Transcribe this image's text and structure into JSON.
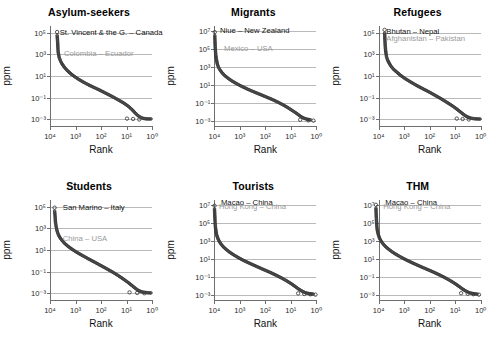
{
  "figure": {
    "panel_count": 6,
    "marker_style": "open-circle",
    "marker_color": "#3a3a3a",
    "grid_color": "#b9b9b9",
    "axis_color": "#6f6f6f",
    "primary_annotation_color": "#111111",
    "secondary_annotation_color": "#9a9a9a"
  },
  "common": {
    "xlabel": "Rank",
    "ylabel": "ppm",
    "xticks": [
      "10⁴",
      "10³",
      "10²",
      "10¹",
      "10⁰"
    ],
    "xtick_exponents": [
      4,
      3,
      2,
      1,
      0
    ],
    "xlim": [
      4,
      0
    ],
    "x_reversed": true
  },
  "chart_data": [
    {
      "type": "scatter",
      "title": "Asylum-seekers",
      "xlabel": "Rank",
      "ylabel": "ppm",
      "xlim": [
        4,
        0
      ],
      "ylim": [
        -3.6,
        5.6
      ],
      "grid": true,
      "xticks": [
        4,
        3,
        2,
        1,
        0
      ],
      "xtick_labels": [
        "10⁴",
        "10³",
        "10²",
        "10¹",
        "10⁰"
      ],
      "yticks": [
        5,
        3,
        1,
        -1,
        -3
      ],
      "ytick_labels": [
        "10⁵",
        "10³",
        "10¹",
        "10⁻¹",
        "10⁻³"
      ],
      "annotations": [
        {
          "text": "St. Vincent & the G. – Canada",
          "style": "primary",
          "x_log": 3.62,
          "y_log": 5.0
        },
        {
          "text": "Colombia – Ecuador",
          "style": "secondary",
          "x_log": 3.45,
          "y_log": 3.0
        }
      ],
      "curve_points_loglog": [
        [
          3.72,
          4.75
        ],
        [
          3.7,
          4.1
        ],
        [
          3.69,
          3.55
        ],
        [
          3.68,
          3.2
        ],
        [
          3.66,
          2.95
        ],
        [
          3.64,
          2.7
        ],
        [
          3.6,
          2.45
        ],
        [
          3.55,
          2.2
        ],
        [
          3.48,
          1.95
        ],
        [
          3.4,
          1.7
        ],
        [
          3.3,
          1.45
        ],
        [
          3.18,
          1.2
        ],
        [
          3.04,
          0.95
        ],
        [
          2.88,
          0.7
        ],
        [
          2.7,
          0.45
        ],
        [
          2.5,
          0.2
        ],
        [
          2.28,
          -0.05
        ],
        [
          2.05,
          -0.3
        ],
        [
          1.8,
          -0.6
        ],
        [
          1.55,
          -0.9
        ],
        [
          1.32,
          -1.2
        ],
        [
          1.1,
          -1.5
        ],
        [
          0.92,
          -1.8
        ],
        [
          0.78,
          -2.1
        ],
        [
          0.66,
          -2.4
        ],
        [
          0.55,
          -2.65
        ],
        [
          0.45,
          -2.8
        ],
        [
          0.34,
          -2.9
        ],
        [
          0.2,
          -2.95
        ],
        [
          0.0,
          -2.95
        ]
      ],
      "tail_outliers": [
        [
          0.98,
          -2.92
        ],
        [
          0.74,
          -2.95
        ],
        [
          0.5,
          -3.0
        ]
      ]
    },
    {
      "type": "scatter",
      "title": "Migrants",
      "xlabel": "Rank",
      "ylabel": "ppm",
      "xlim": [
        4,
        0
      ],
      "ylim": [
        -3.6,
        7.6
      ],
      "grid": true,
      "xticks": [
        4,
        3,
        2,
        1,
        0
      ],
      "xtick_labels": [
        "10⁴",
        "10³",
        "10²",
        "10¹",
        "10⁰"
      ],
      "yticks": [
        7,
        5,
        3,
        1,
        -1,
        -3
      ],
      "ytick_labels": [
        "10⁷",
        "10⁵",
        "10³",
        "10¹",
        "10⁻¹",
        "10⁻³"
      ],
      "annotations": [
        {
          "text": "Niue – New Zealand",
          "style": "primary",
          "x_log": 3.78,
          "y_log": 7.0
        },
        {
          "text": "Mexico – USA",
          "style": "secondary",
          "x_log": 3.62,
          "y_log": 5.0
        }
      ],
      "curve_points_loglog": [
        [
          3.97,
          6.55
        ],
        [
          3.96,
          5.8
        ],
        [
          3.95,
          5.2
        ],
        [
          3.94,
          4.7
        ],
        [
          3.93,
          4.3
        ],
        [
          3.91,
          3.95
        ],
        [
          3.89,
          3.6
        ],
        [
          3.86,
          3.25
        ],
        [
          3.82,
          2.95
        ],
        [
          3.76,
          2.65
        ],
        [
          3.68,
          2.35
        ],
        [
          3.58,
          2.05
        ],
        [
          3.45,
          1.75
        ],
        [
          3.3,
          1.45
        ],
        [
          3.12,
          1.15
        ],
        [
          2.92,
          0.85
        ],
        [
          2.7,
          0.55
        ],
        [
          2.46,
          0.25
        ],
        [
          2.2,
          -0.05
        ],
        [
          1.95,
          -0.35
        ],
        [
          1.7,
          -0.65
        ],
        [
          1.48,
          -0.95
        ],
        [
          1.28,
          -1.25
        ],
        [
          1.1,
          -1.55
        ],
        [
          0.94,
          -1.85
        ],
        [
          0.78,
          -2.15
        ],
        [
          0.64,
          -2.45
        ],
        [
          0.5,
          -2.7
        ],
        [
          0.34,
          -2.85
        ],
        [
          0.18,
          -2.92
        ]
      ],
      "tail_outliers": [
        [
          0.62,
          -2.9
        ],
        [
          0.3,
          -2.97
        ],
        [
          0.1,
          -3.0
        ]
      ]
    },
    {
      "type": "scatter",
      "title": "Refugees",
      "xlabel": "Rank",
      "ylabel": "ppm",
      "xlim": [
        4,
        0
      ],
      "ylim": [
        -3.6,
        5.6
      ],
      "grid": true,
      "xticks": [
        4,
        3,
        2,
        1,
        0
      ],
      "xtick_labels": [
        "10⁴",
        "10³",
        "10²",
        "10¹",
        "10⁰"
      ],
      "yticks": [
        5,
        3,
        1,
        -1,
        -3
      ],
      "ytick_labels": [
        "10⁵",
        "10³",
        "10¹",
        "10⁻¹",
        "10⁻³"
      ],
      "annotations": [
        {
          "text": "Bhutan – Nepal",
          "style": "primary",
          "x_log": 3.7,
          "y_log": 5.05
        },
        {
          "text": "Afghanistan – Pakistan",
          "style": "secondary",
          "x_log": 3.7,
          "y_log": 4.45
        }
      ],
      "curve_points_loglog": [
        [
          3.78,
          4.95
        ],
        [
          3.77,
          4.4
        ],
        [
          3.76,
          3.95
        ],
        [
          3.75,
          3.6
        ],
        [
          3.74,
          3.3
        ],
        [
          3.72,
          3.0
        ],
        [
          3.7,
          2.72
        ],
        [
          3.66,
          2.45
        ],
        [
          3.6,
          2.18
        ],
        [
          3.53,
          1.9
        ],
        [
          3.43,
          1.62
        ],
        [
          3.3,
          1.35
        ],
        [
          3.15,
          1.05
        ],
        [
          2.97,
          0.75
        ],
        [
          2.76,
          0.45
        ],
        [
          2.54,
          0.15
        ],
        [
          2.3,
          -0.15
        ],
        [
          2.05,
          -0.45
        ],
        [
          1.8,
          -0.78
        ],
        [
          1.56,
          -1.1
        ],
        [
          1.34,
          -1.42
        ],
        [
          1.14,
          -1.72
        ],
        [
          0.96,
          -2.02
        ],
        [
          0.8,
          -2.32
        ],
        [
          0.66,
          -2.58
        ],
        [
          0.54,
          -2.76
        ],
        [
          0.42,
          -2.86
        ],
        [
          0.3,
          -2.92
        ],
        [
          0.16,
          -2.95
        ],
        [
          0.0,
          -2.96
        ]
      ],
      "tail_outliers": [
        [
          0.95,
          -2.92
        ],
        [
          0.72,
          -2.96
        ],
        [
          0.48,
          -3.0
        ]
      ]
    },
    {
      "type": "scatter",
      "title": "Students",
      "xlabel": "Rank",
      "ylabel": "ppm",
      "xlim": [
        4,
        0
      ],
      "ylim": [
        -3.6,
        5.6
      ],
      "grid": true,
      "xticks": [
        4,
        3,
        2,
        1,
        0
      ],
      "xtick_labels": [
        "10⁴",
        "10³",
        "10²",
        "10¹",
        "10⁰"
      ],
      "yticks": [
        5,
        3,
        1,
        -1,
        -3
      ],
      "ytick_labels": [
        "10⁵",
        "10³",
        "10¹",
        "10⁻¹",
        "10⁻³"
      ],
      "annotations": [
        {
          "text": "San Marino – Italy",
          "style": "primary",
          "x_log": 3.5,
          "y_log": 4.85
        },
        {
          "text": "China – USA",
          "style": "secondary",
          "x_log": 3.5,
          "y_log": 2.05
        }
      ],
      "curve_points_loglog": [
        [
          3.82,
          4.6
        ],
        [
          3.8,
          4.1
        ],
        [
          3.79,
          3.75
        ],
        [
          3.78,
          3.45
        ],
        [
          3.76,
          3.18
        ],
        [
          3.74,
          2.92
        ],
        [
          3.71,
          2.66
        ],
        [
          3.67,
          2.4
        ],
        [
          3.61,
          2.14
        ],
        [
          3.53,
          1.88
        ],
        [
          3.43,
          1.62
        ],
        [
          3.3,
          1.35
        ],
        [
          3.14,
          1.08
        ],
        [
          2.96,
          0.8
        ],
        [
          2.75,
          0.52
        ],
        [
          2.52,
          0.22
        ],
        [
          2.28,
          -0.08
        ],
        [
          2.03,
          -0.4
        ],
        [
          1.78,
          -0.72
        ],
        [
          1.54,
          -1.04
        ],
        [
          1.32,
          -1.36
        ],
        [
          1.12,
          -1.68
        ],
        [
          0.94,
          -1.98
        ],
        [
          0.78,
          -2.28
        ],
        [
          0.64,
          -2.55
        ],
        [
          0.52,
          -2.74
        ],
        [
          0.4,
          -2.85
        ],
        [
          0.28,
          -2.9
        ],
        [
          0.14,
          -2.94
        ],
        [
          0.0,
          -2.95
        ]
      ],
      "tail_outliers": [
        [
          0.88,
          -2.9
        ],
        [
          0.58,
          -2.95
        ],
        [
          0.3,
          -2.98
        ]
      ]
    },
    {
      "type": "scatter",
      "title": "Tourists",
      "xlabel": "Rank",
      "ylabel": "ppm",
      "xlim": [
        4,
        0
      ],
      "ylim": [
        -3.6,
        7.6
      ],
      "grid": true,
      "xticks": [
        4,
        3,
        2,
        1,
        0
      ],
      "xtick_labels": [
        "10⁴",
        "10³",
        "10²",
        "10¹",
        "10⁰"
      ],
      "yticks": [
        7,
        5,
        3,
        1,
        -1,
        -3
      ],
      "ytick_labels": [
        "10⁷",
        "10⁵",
        "10³",
        "10¹",
        "10⁻¹",
        "10⁻³"
      ],
      "annotations": [
        {
          "text": "Macao – China",
          "style": "primary",
          "x_log": 3.74,
          "y_log": 7.22
        },
        {
          "text": "Hong Kong – China",
          "style": "secondary",
          "x_log": 3.82,
          "y_log": 6.85
        }
      ],
      "curve_points_loglog": [
        [
          3.98,
          6.6
        ],
        [
          3.97,
          5.9
        ],
        [
          3.96,
          5.3
        ],
        [
          3.95,
          4.85
        ],
        [
          3.94,
          4.45
        ],
        [
          3.92,
          4.08
        ],
        [
          3.9,
          3.72
        ],
        [
          3.86,
          3.38
        ],
        [
          3.81,
          3.05
        ],
        [
          3.74,
          2.72
        ],
        [
          3.65,
          2.4
        ],
        [
          3.53,
          2.08
        ],
        [
          3.39,
          1.76
        ],
        [
          3.22,
          1.44
        ],
        [
          3.03,
          1.12
        ],
        [
          2.82,
          0.8
        ],
        [
          2.58,
          0.48
        ],
        [
          2.33,
          0.16
        ],
        [
          2.08,
          -0.16
        ],
        [
          1.82,
          -0.48
        ],
        [
          1.58,
          -0.8
        ],
        [
          1.36,
          -1.12
        ],
        [
          1.16,
          -1.44
        ],
        [
          0.98,
          -1.76
        ],
        [
          0.82,
          -2.08
        ],
        [
          0.68,
          -2.38
        ],
        [
          0.54,
          -2.62
        ],
        [
          0.4,
          -2.8
        ],
        [
          0.24,
          -2.9
        ],
        [
          0.08,
          -2.94
        ]
      ],
      "tail_outliers": [
        [
          0.7,
          -2.86
        ],
        [
          0.46,
          -2.92
        ],
        [
          0.22,
          -2.96
        ],
        [
          0.02,
          -3.0
        ]
      ]
    },
    {
      "type": "scatter",
      "title": "THM",
      "xlabel": "Rank",
      "ylabel": "ppm",
      "xlim": [
        4,
        0
      ],
      "ylim": [
        -3.6,
        7.6
      ],
      "grid": true,
      "xticks": [
        4,
        3,
        2,
        1,
        0
      ],
      "xtick_labels": [
        "10⁴",
        "10³",
        "10²",
        "10¹",
        "10⁰"
      ],
      "yticks": [
        7,
        5,
        3,
        1,
        -1,
        -3
      ],
      "ytick_labels": [
        "10⁷",
        "10⁵",
        "10³",
        "10¹",
        "10⁻¹",
        "10⁻³"
      ],
      "annotations": [
        {
          "text": "Macao – China",
          "style": "primary",
          "x_log": 3.74,
          "y_log": 7.22
        },
        {
          "text": "Hong Kong – China",
          "style": "secondary",
          "x_log": 3.82,
          "y_log": 6.85
        }
      ],
      "curve_points_loglog": [
        [
          4.12,
          6.7
        ],
        [
          4.11,
          6.0
        ],
        [
          4.1,
          5.4
        ],
        [
          4.09,
          4.92
        ],
        [
          4.08,
          4.5
        ],
        [
          4.06,
          4.12
        ],
        [
          4.03,
          3.76
        ],
        [
          3.99,
          3.4
        ],
        [
          3.93,
          3.05
        ],
        [
          3.85,
          2.72
        ],
        [
          3.75,
          2.4
        ],
        [
          3.62,
          2.08
        ],
        [
          3.47,
          1.76
        ],
        [
          3.29,
          1.44
        ],
        [
          3.09,
          1.12
        ],
        [
          2.87,
          0.8
        ],
        [
          2.63,
          0.48
        ],
        [
          2.38,
          0.16
        ],
        [
          2.12,
          -0.16
        ],
        [
          1.86,
          -0.48
        ],
        [
          1.62,
          -0.8
        ],
        [
          1.4,
          -1.12
        ],
        [
          1.2,
          -1.44
        ],
        [
          1.02,
          -1.76
        ],
        [
          0.86,
          -2.08
        ],
        [
          0.72,
          -2.38
        ],
        [
          0.58,
          -2.62
        ],
        [
          0.44,
          -2.8
        ],
        [
          0.28,
          -2.9
        ],
        [
          0.12,
          -2.94
        ]
      ],
      "tail_outliers": [
        [
          0.78,
          -2.84
        ],
        [
          0.52,
          -2.9
        ],
        [
          0.3,
          -2.95
        ],
        [
          0.08,
          -3.0
        ]
      ]
    }
  ]
}
